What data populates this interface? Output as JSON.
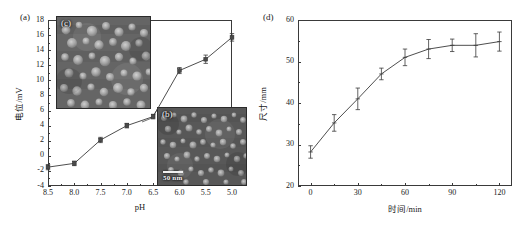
{
  "figure": {
    "width": 525,
    "height": 240,
    "background": "#ffffff",
    "line_color": "#3a3a3a",
    "marker_color": "#4a4a4a"
  },
  "panel_a": {
    "tag": "(a)",
    "insets": [
      {
        "tag": "(c)",
        "scalebar_text": ""
      },
      {
        "tag": "(b)",
        "scalebar_text": "50 nm"
      }
    ]
  },
  "panel_d": {
    "tag": "(d)"
  },
  "chart_data": [
    {
      "id": "panel_a",
      "type": "line",
      "panel_label": "(a)",
      "title": "",
      "xlabel": "pH",
      "ylabel": "电位/mV",
      "x": [
        8.5,
        8.0,
        7.5,
        7.0,
        6.5,
        6.0,
        5.5,
        5.0
      ],
      "xtick_labels": [
        "8.5",
        "8.0",
        "7.5",
        "7.0",
        "6.5",
        "6.0",
        "5.5",
        "5.0"
      ],
      "values": [
        -1.5,
        -1.0,
        2.1,
        4.0,
        5.2,
        11.3,
        12.8,
        15.7
      ],
      "yerr": [
        0.35,
        0.3,
        0.35,
        0.3,
        0.3,
        0.4,
        0.55,
        0.5
      ],
      "ylim": [
        -4,
        18
      ],
      "ytick_labels": [
        "-4",
        "-2",
        "0",
        "2",
        "4",
        "6",
        "8",
        "10",
        "12",
        "14",
        "16",
        "18"
      ],
      "yticks": [
        -4,
        -2,
        0,
        2,
        4,
        6,
        8,
        10,
        12,
        14,
        16,
        18
      ],
      "x_axis_inverted": true,
      "grid": false,
      "legend": "none",
      "marker": "square"
    },
    {
      "id": "panel_d",
      "type": "line",
      "panel_label": "(d)",
      "title": "",
      "xlabel": "时间/min",
      "ylabel": "尺寸/mm",
      "x": [
        0,
        15,
        30,
        45,
        60,
        75,
        90,
        105,
        120
      ],
      "xtick_labels": [
        "0",
        "30",
        "60",
        "90",
        "120"
      ],
      "xticks": [
        0,
        30,
        60,
        90,
        120
      ],
      "values": [
        28.2,
        35.2,
        41.0,
        47.0,
        51.0,
        53.0,
        53.9,
        53.9,
        54.8
      ],
      "yerr": [
        1.5,
        2.0,
        2.6,
        1.4,
        2.0,
        2.3,
        1.5,
        2.8,
        2.3
      ],
      "ylim": [
        20,
        60
      ],
      "xlim": [
        -8,
        128
      ],
      "ytick_labels": [
        "20",
        "30",
        "40",
        "50",
        "60"
      ],
      "yticks": [
        20,
        30,
        40,
        50,
        60
      ],
      "grid": false,
      "legend": "none",
      "marker": "plus"
    }
  ]
}
